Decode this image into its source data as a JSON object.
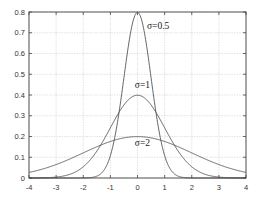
{
  "chart_data": {
    "type": "line",
    "title": "",
    "xlabel": "",
    "ylabel": "",
    "xlim": [
      -4,
      4
    ],
    "ylim": [
      0,
      0.8
    ],
    "grid": true,
    "legend": "none (inline annotations)",
    "x_ticks": [
      "-4",
      "-3",
      "-2",
      "-1",
      "0",
      "1",
      "2",
      "3",
      "4"
    ],
    "y_ticks": [
      "0",
      "0.1",
      "0.2",
      "0.3",
      "0.4",
      "0.5",
      "0.6",
      "0.7",
      "0.8"
    ],
    "series": [
      {
        "name": "σ=0.5",
        "sigma": 0.5,
        "mu": 0,
        "peak": 0.798,
        "x": [
          -4,
          -3,
          -2,
          -1.5,
          -1,
          -0.75,
          -0.5,
          -0.25,
          0,
          0.25,
          0.5,
          0.75,
          1,
          1.5,
          2,
          3,
          4
        ],
        "values": [
          0.0,
          0.0,
          0.0003,
          0.0089,
          0.108,
          0.259,
          0.484,
          0.704,
          0.798,
          0.704,
          0.484,
          0.259,
          0.108,
          0.0089,
          0.0003,
          0.0,
          0.0
        ]
      },
      {
        "name": "σ=1",
        "sigma": 1,
        "mu": 0,
        "peak": 0.399,
        "x": [
          -4,
          -3,
          -2,
          -1.5,
          -1,
          -0.5,
          0,
          0.5,
          1,
          1.5,
          2,
          3,
          4
        ],
        "values": [
          0.0001,
          0.0044,
          0.054,
          0.1295,
          0.242,
          0.352,
          0.399,
          0.352,
          0.242,
          0.1295,
          0.054,
          0.0044,
          0.0001
        ]
      },
      {
        "name": "σ=2",
        "sigma": 2,
        "mu": 0,
        "peak": 0.199,
        "x": [
          -4,
          -3,
          -2,
          -1,
          0,
          1,
          2,
          3,
          4
        ],
        "values": [
          0.027,
          0.065,
          0.121,
          0.176,
          0.199,
          0.176,
          0.121,
          0.065,
          0.027
        ]
      }
    ],
    "annotations": [
      {
        "text": "σ=0.5",
        "x": 0.35,
        "y": 0.72
      },
      {
        "text": "σ=1",
        "x": -0.1,
        "y": 0.435
      },
      {
        "text": "σ=2",
        "x": -0.1,
        "y": 0.155
      }
    ]
  }
}
